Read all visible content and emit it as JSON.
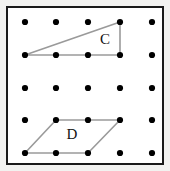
{
  "figure": {
    "background_color": "#ffffff",
    "frame_color": "#1a1a1a",
    "outer_mat_color": "#f2f2f0"
  },
  "grid": {
    "rows": 5,
    "cols": 5,
    "dot_color": "#000000",
    "dot_radius": 3.1,
    "x_positions": [
      25,
      56,
      88,
      120,
      152
    ],
    "y_positions": [
      22,
      55,
      88,
      120,
      153
    ]
  },
  "shapes": [
    {
      "id": "shape-c",
      "name": "triangle",
      "label": "C",
      "label_x": 105,
      "label_y": 41,
      "stroke_color": "#9a9a9a",
      "stroke_width": 1.6,
      "fill": "none",
      "vertices": [
        {
          "x": 25,
          "y": 55
        },
        {
          "x": 120,
          "y": 22
        },
        {
          "x": 120,
          "y": 55
        }
      ],
      "vertex_grid_coords": [
        {
          "col": 0,
          "row": 1
        },
        {
          "col": 3,
          "row": 0
        },
        {
          "col": 3,
          "row": 1
        }
      ]
    },
    {
      "id": "shape-d",
      "name": "parallelogram",
      "label": "D",
      "label_x": 72,
      "label_y": 136,
      "stroke_color": "#9a9a9a",
      "stroke_width": 1.6,
      "fill": "none",
      "vertices": [
        {
          "x": 56,
          "y": 120
        },
        {
          "x": 120,
          "y": 120
        },
        {
          "x": 88,
          "y": 153
        },
        {
          "x": 25,
          "y": 153
        }
      ],
      "vertex_grid_coords": [
        {
          "col": 1,
          "row": 3
        },
        {
          "col": 3,
          "row": 3
        },
        {
          "col": 2,
          "row": 4
        },
        {
          "col": 0,
          "row": 4
        }
      ]
    }
  ]
}
